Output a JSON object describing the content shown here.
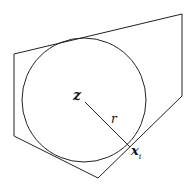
{
  "diagram": {
    "labels": {
      "center": "z",
      "radius": "r",
      "point": "x",
      "point_subscript": "i"
    },
    "polygon": [
      [
        14,
        54
      ],
      [
        182,
        14
      ],
      [
        182,
        96
      ],
      [
        98,
        178
      ],
      [
        14,
        136
      ]
    ],
    "circle": {
      "cx": 84,
      "cy": 100,
      "r": 62
    },
    "radius_segment": {
      "from": [
        85,
        102
      ],
      "to": [
        130,
        147
      ]
    },
    "stroke_color": "#222222"
  }
}
